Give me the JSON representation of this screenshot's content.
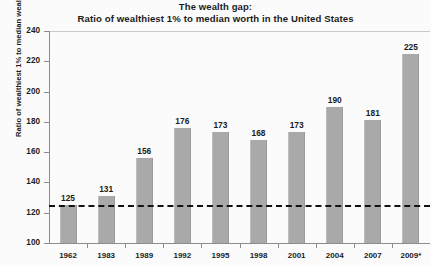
{
  "chart_data": {
    "type": "bar",
    "title": "The wealth gap:\nRatio of wealthiest 1% to median worth in the United States",
    "title_line1": "The wealth gap:",
    "title_line2": "Ratio of wealthiest 1% to median worth in the United States",
    "xlabel": "",
    "ylabel": "Ratio of wealthiest 1% to median wealth",
    "categories": [
      "1962",
      "1983",
      "1989",
      "1992",
      "1995",
      "1998",
      "2001",
      "2004",
      "2007",
      "2009*"
    ],
    "values": [
      125,
      131,
      156,
      176,
      173,
      168,
      173,
      190,
      181,
      225
    ],
    "value_labels": [
      "125",
      "131",
      "156",
      "176",
      "173",
      "168",
      "173",
      "190",
      "181",
      "225"
    ],
    "ylim": [
      100,
      240
    ],
    "yticks": [
      100,
      120,
      140,
      160,
      180,
      200,
      220,
      240
    ],
    "ytick_labels": [
      "100",
      "120",
      "140",
      "160",
      "180",
      "200",
      "220",
      "240"
    ],
    "grid": false,
    "legend": false,
    "legend_position": "none",
    "bar_color": "#a9a9a9",
    "reference_line": {
      "value": 125,
      "style": "dashed",
      "color": "#111111"
    },
    "background_color": "#fbfbfb",
    "axis_color": "#8c8c8c"
  }
}
